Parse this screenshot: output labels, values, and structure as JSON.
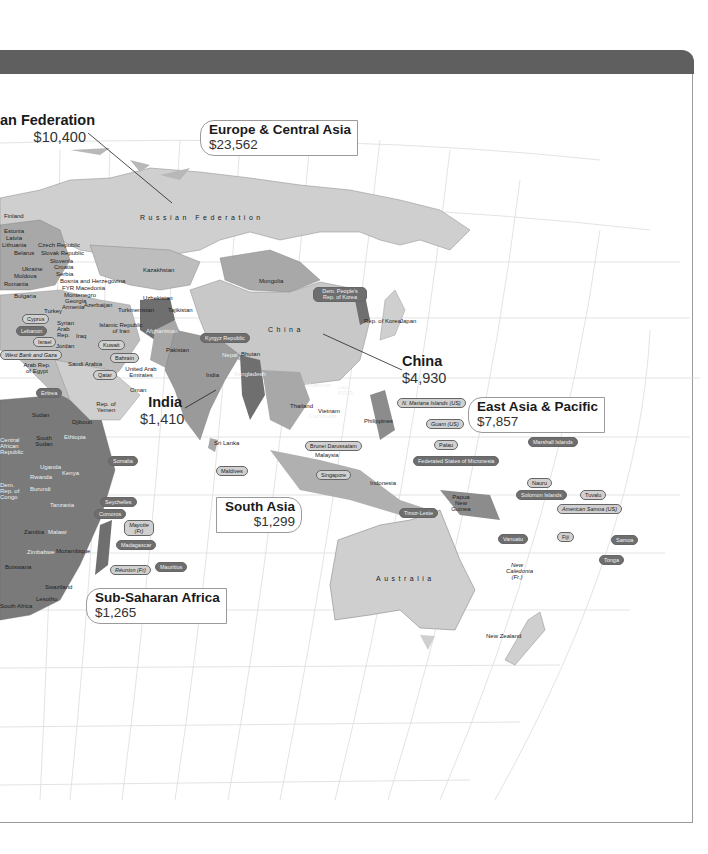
{
  "header": {
    "bar_color": "#5f5f5f"
  },
  "colors": {
    "land_light": "#cfcfcf",
    "land_mid": "#a8a8a8",
    "land_dark": "#6f6f6f",
    "land_darker": "#555555",
    "grid": "#dcdcdc",
    "ocean": "#ffffff"
  },
  "regions": [
    {
      "id": "europe-central-asia",
      "name": "Europe & Central Asia",
      "value": "$23,562"
    },
    {
      "id": "east-asia-pacific",
      "name": "East Asia & Pacific",
      "value": "$7,857"
    },
    {
      "id": "south-asia",
      "name": "South Asia",
      "value": "$1,299"
    },
    {
      "id": "sub-saharan-africa",
      "name": "Sub-Saharan Africa",
      "value": "$1,265"
    }
  ],
  "countries_highlighted": [
    {
      "id": "russian-federation",
      "name": "an Federation",
      "value": "$10,400"
    },
    {
      "id": "china",
      "name": "China",
      "value": "$4,930"
    },
    {
      "id": "india",
      "name": "India",
      "value": "$1,410"
    }
  ],
  "big_labels": {
    "russia": "Russian Federation",
    "china": "China",
    "australia": "Australia"
  },
  "country_labels": {
    "finland": "Finland",
    "estonia": "Estonia",
    "latvia": "Latvia",
    "lithuania": "Lithuania",
    "czech": "Czech Republic",
    "belarus": "Belarus",
    "slovak": "Slovak Republic",
    "slovenia": "Slovenia",
    "ukraine": "Ukraine",
    "croatia": "Croatia",
    "moldova": "Moldova",
    "serbia": "Serbia",
    "romania": "Romania",
    "bosnia": "Bosnia and Herzegovina",
    "fyr_macedonia": "FYR Macedonia",
    "montenegro": "Montenegro",
    "bulgaria": "Bulgaria",
    "georgia": "Georgia",
    "armenia": "Armenia",
    "azerbaijan": "Azerbaijan",
    "kazakhstan": "Kazakhstan",
    "uzbekistan": "Uzbekistan",
    "turkmenistan": "Turkmenistan",
    "tajikistan": "Tajikistan",
    "mongolia": "Mongolia",
    "dprk": "Dem. People's Rep. of Korea",
    "rok": "Rep. of Korea",
    "japan": "Japan",
    "turkey": "Turkey",
    "cyprus": "Cyprus",
    "syria": "Syrian Arab Rep.",
    "lebanon": "Lebanon",
    "iran": "Islamic Republic of Iran",
    "iraq": "Iraq",
    "israel": "Israel",
    "jordan": "Jordan",
    "west_bank": "West Bank and Gaza",
    "kuwait": "Kuwait",
    "afghanistan": "Afghanistan",
    "pakistan": "Pakistan",
    "nepal": "Nepal",
    "bhutan": "Bhutan",
    "bangladesh": "Bangladesh",
    "india_small": "India",
    "egypt": "Arab Rep. of Egypt",
    "saudi": "Saudi Arabia",
    "bahrain": "Bahrain",
    "qatar": "Qatar",
    "uae": "United Arab Emirates",
    "oman": "Oman",
    "yemen": "Rep. of Yemen",
    "eritrea": "Eritrea",
    "sudan": "Sudan",
    "djibouti": "Djibouti",
    "south_sudan": "South Sudan",
    "ethiopia": "Ethiopia",
    "car": "Central African Republic",
    "somalia": "Somalia",
    "uganda": "Uganda",
    "kenya": "Kenya",
    "rwanda": "Rwanda",
    "drc": "Dem. Rep. of Congo",
    "burundi": "Burundi",
    "tanzania": "Tanzania",
    "zambia": "Zambia",
    "malawi": "Malawi",
    "zimbabwe": "Zimbabwe",
    "mozambique": "Mozambique",
    "botswana": "Botswana",
    "swaziland": "Swaziland",
    "lesotho": "Lesotho",
    "south_africa": "South Africa",
    "sri_lanka": "Sri Lanka",
    "maldives": "Maldives",
    "myanmar": "Myanmar",
    "lao": "Lao P.D.R.",
    "thailand": "Thailand",
    "vietnam": "Vietnam",
    "cambodia": "Cambodia",
    "philippines": "Philippines",
    "brunei": "Brunei Darussalam",
    "malaysia": "Malaysia",
    "singapore": "Singapore",
    "indonesia": "Indonesia",
    "png": "Papua New Guinea",
    "timor": "Timor-Leste",
    "kyrgyz": "Kyrgyz Republic",
    "new_zealand": "New Zealand",
    "new_caledonia": "New Caledonia (Fr.)",
    "chad": "Chad"
  },
  "island_pills": {
    "seychelles": "Seychelles",
    "comoros": "Comoros",
    "mayotte": "Mayotte (Fr)",
    "madagascar": "Madagascar",
    "reunion": "Réunion (Fr)",
    "mauritius": "Mauritius",
    "n_mariana": "N. Mariana Islands (US)",
    "guam": "Guam (US)",
    "palau": "Palau",
    "micronesia": "Federated States of Micronesia",
    "marshall": "Marshall Islands",
    "nauru": "Nauru",
    "solomon": "Solomon Islands",
    "tuvalu": "Tuvalu",
    "american_samoa": "American Samoa (US)",
    "vanuatu": "Vanuatu",
    "fiji": "Fiji",
    "samoa": "Samoa",
    "tonga": "Tonga"
  }
}
